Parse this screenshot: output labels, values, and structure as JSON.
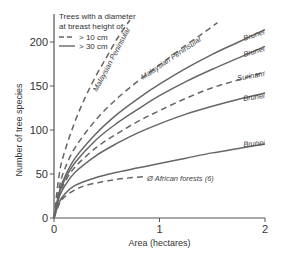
{
  "chart_data": {
    "type": "line",
    "title": "",
    "xlabel": "Area (hectares)",
    "ylabel": "Number of tree species",
    "xlim": [
      0,
      2
    ],
    "ylim": [
      0,
      225
    ],
    "x_ticks": [
      "0",
      "1",
      "2"
    ],
    "y_ticks": [
      "0",
      "50",
      "100",
      "150",
      "200"
    ],
    "grid": false,
    "legend": {
      "title_line1": "Trees with a diameter",
      "title_line2": "at breast height of:",
      "entries": [
        {
          "label": "> 10 cm",
          "style": "dashed"
        },
        {
          "label": "> 30 cm",
          "style": "solid"
        }
      ],
      "position": "top-left"
    },
    "series": [
      {
        "name": "Malaysian Peninsular",
        "style": "dashed",
        "dbh": "> 10 cm",
        "x": [
          0,
          0.05,
          0.1,
          0.2,
          0.3,
          0.4,
          0.5,
          0.6,
          0.72
        ],
        "values": [
          0,
          50,
          75,
          110,
          138,
          162,
          183,
          204,
          225
        ]
      },
      {
        "name": "Malaysian Peninsular",
        "style": "dashed",
        "dbh": "> 10 cm",
        "x": [
          0,
          0.05,
          0.1,
          0.2,
          0.4,
          0.6,
          0.8,
          1.0,
          1.2,
          1.4,
          1.55
        ],
        "values": [
          0,
          35,
          55,
          80,
          112,
          136,
          156,
          174,
          192,
          209,
          222
        ]
      },
      {
        "name": "Brunei",
        "style": "solid",
        "dbh": "> 30 cm",
        "x": [
          0,
          0.05,
          0.1,
          0.2,
          0.4,
          0.6,
          0.8,
          1.0,
          1.25,
          1.5,
          1.75,
          2.0
        ],
        "values": [
          0,
          30,
          46,
          68,
          96,
          118,
          136,
          152,
          170,
          186,
          200,
          214
        ]
      },
      {
        "name": "Brunei",
        "style": "solid",
        "dbh": "> 30 cm",
        "x": [
          0,
          0.05,
          0.1,
          0.2,
          0.4,
          0.6,
          0.8,
          1.0,
          1.25,
          1.5,
          1.75,
          2.0
        ],
        "values": [
          0,
          28,
          43,
          63,
          89,
          108,
          124,
          139,
          155,
          169,
          182,
          195
        ]
      },
      {
        "name": "Surinam",
        "style": "dashed",
        "dbh": "> 10 cm",
        "x": [
          0,
          0.05,
          0.1,
          0.2,
          0.4,
          0.6,
          0.8,
          1.0,
          1.25,
          1.5,
          1.75,
          2.0
        ],
        "values": [
          0,
          26,
          40,
          58,
          80,
          96,
          110,
          122,
          136,
          148,
          157,
          166
        ]
      },
      {
        "name": "Brunei",
        "style": "solid",
        "dbh": "> 30 cm",
        "x": [
          0,
          0.05,
          0.1,
          0.2,
          0.4,
          0.6,
          0.8,
          1.0,
          1.25,
          1.5,
          1.75,
          2.0
        ],
        "values": [
          0,
          24,
          36,
          52,
          71,
          85,
          97,
          107,
          118,
          127,
          135,
          142
        ]
      },
      {
        "name": "Brunei",
        "style": "solid",
        "dbh": "> 30 cm",
        "x": [
          0,
          0.05,
          0.1,
          0.2,
          0.4,
          0.6,
          0.8,
          1.0,
          1.25,
          1.5,
          1.75,
          2.0
        ],
        "values": [
          0,
          18,
          27,
          37,
          46,
          52,
          57,
          62,
          68,
          74,
          79,
          84
        ]
      },
      {
        "name": "Ø African forests (6)",
        "style": "dashed",
        "dbh": "> 10 cm",
        "x": [
          0,
          0.05,
          0.1,
          0.2,
          0.3,
          0.45,
          0.6,
          0.75,
          0.86
        ],
        "values": [
          0,
          16,
          24,
          32,
          37,
          41,
          44,
          46,
          47
        ]
      }
    ],
    "annotations": [
      {
        "text": "Malaysian Peninsular",
        "target_series": 0
      },
      {
        "text": "Malaysian Peninsular",
        "target_series": 1
      },
      {
        "text": "Brunei",
        "target_series": 2
      },
      {
        "text": "Brunei",
        "target_series": 3
      },
      {
        "text": "Surinam",
        "target_series": 4
      },
      {
        "text": "Brunei",
        "target_series": 5
      },
      {
        "text": "Brunei",
        "target_series": 6
      },
      {
        "text": "Ø African forests (6)",
        "target_series": 7
      }
    ],
    "colors": {
      "line": "#666666",
      "axis": "#555555",
      "text": "#333333"
    }
  }
}
